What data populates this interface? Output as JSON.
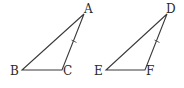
{
  "diagram": {
    "type": "geometry-congruent-triangles",
    "triangles": [
      {
        "name": "triangle-abc",
        "vertices": [
          {
            "label": "A",
            "x": 84,
            "y": 14,
            "lx": 84,
            "ly": 13
          },
          {
            "label": "B",
            "x": 22,
            "y": 70,
            "lx": 10,
            "ly": 75
          },
          {
            "label": "C",
            "x": 62,
            "y": 70,
            "lx": 63,
            "ly": 75
          }
        ],
        "tick_side": "AC",
        "tick": {
          "x": 74,
          "y": 41
        }
      },
      {
        "name": "triangle-def",
        "vertices": [
          {
            "label": "D",
            "x": 167,
            "y": 14,
            "lx": 167,
            "ly": 13
          },
          {
            "label": "E",
            "x": 106,
            "y": 70,
            "lx": 94,
            "ly": 75
          },
          {
            "label": "F",
            "x": 145,
            "y": 70,
            "lx": 146,
            "ly": 75
          }
        ],
        "tick_side": "DF",
        "tick": {
          "x": 157,
          "y": 41
        }
      }
    ],
    "labels": {
      "A": "A",
      "B": "B",
      "C": "C",
      "D": "D",
      "E": "E",
      "F": "F"
    },
    "colors": {
      "stroke": "#3a3a3a",
      "text": "#2a2a2a",
      "background": "#ffffff"
    }
  }
}
